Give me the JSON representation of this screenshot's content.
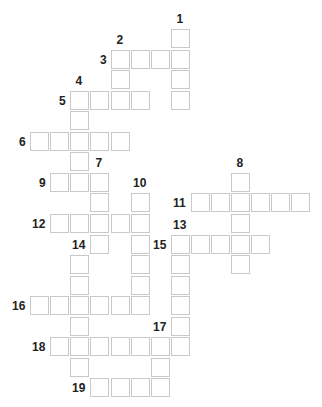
{
  "puzzle": {
    "type": "crossword",
    "grid": {
      "origin_x": 10,
      "origin_y": 29,
      "col_pitch": 20.1,
      "row_pitch": 20.55,
      "cell_size": 18
    },
    "colors": {
      "cell_fill": "#ffffff",
      "cell_border": "#c9c9c9",
      "number": "#222222"
    },
    "entries": [
      {
        "number": "1",
        "direction": "down",
        "row": 0,
        "col": 8,
        "length": 4,
        "label_pos": "above"
      },
      {
        "number": "2",
        "direction": "down",
        "row": 1,
        "col": 5,
        "length": 3,
        "label_pos": "above"
      },
      {
        "number": "3",
        "direction": "across",
        "row": 1,
        "col": 5,
        "length": 4,
        "label_pos": "left"
      },
      {
        "number": "4",
        "direction": "down",
        "row": 3,
        "col": 3,
        "length": 5,
        "label_pos": "above"
      },
      {
        "number": "5",
        "direction": "across",
        "row": 3,
        "col": 3,
        "length": 4,
        "label_pos": "left"
      },
      {
        "number": "6",
        "direction": "across",
        "row": 5,
        "col": 1,
        "length": 5,
        "label_pos": "left"
      },
      {
        "number": "7",
        "direction": "down",
        "row": 7,
        "col": 4,
        "length": 4,
        "label_pos": "above"
      },
      {
        "number": "8",
        "direction": "down",
        "row": 7,
        "col": 11,
        "length": 5,
        "label_pos": "above"
      },
      {
        "number": "9",
        "direction": "across",
        "row": 7,
        "col": 2,
        "length": 3,
        "label_pos": "left"
      },
      {
        "number": "10",
        "direction": "down",
        "row": 8,
        "col": 6,
        "length": 6,
        "label_pos": "above"
      },
      {
        "number": "11",
        "direction": "across",
        "row": 8,
        "col": 9,
        "length": 6,
        "label_pos": "left"
      },
      {
        "number": "12",
        "direction": "across",
        "row": 9,
        "col": 2,
        "length": 5,
        "label_pos": "left"
      },
      {
        "number": "13",
        "direction": "down",
        "row": 10,
        "col": 8,
        "length": 6,
        "label_pos": "above"
      },
      {
        "number": "14",
        "direction": "down",
        "row": 11,
        "col": 3,
        "length": 6,
        "label_pos": "above"
      },
      {
        "number": "15",
        "direction": "across",
        "row": 10,
        "col": 8,
        "length": 5,
        "label_pos": "left"
      },
      {
        "number": "16",
        "direction": "across",
        "row": 13,
        "col": 1,
        "length": 6,
        "label_pos": "left"
      },
      {
        "number": "17",
        "direction": "down",
        "row": 15,
        "col": 7,
        "length": 3,
        "label_pos": "above"
      },
      {
        "number": "18",
        "direction": "across",
        "row": 15,
        "col": 2,
        "length": 7,
        "label_pos": "left"
      },
      {
        "number": "19",
        "direction": "across",
        "row": 17,
        "col": 4,
        "length": 4,
        "label_pos": "left"
      }
    ]
  }
}
